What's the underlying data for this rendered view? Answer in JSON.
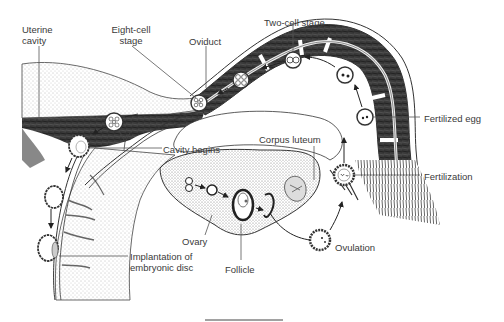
{
  "diagram": {
    "labels": {
      "uterine_cavity": [
        "Uterine",
        "cavity"
      ],
      "eight_cell_stage": [
        "Eight-cell",
        "stage"
      ],
      "oviduct": "Oviduct",
      "two_cell_stage": "Two-cell stage",
      "fertilized_egg": "Fertilized egg",
      "corpus_luteum": "Corpus luteum",
      "cavity_begins": "Cavity begins",
      "fertilization": "Fertilization",
      "ovary": "Ovary",
      "follicle": "Follicle",
      "ovulation": "Ovulation",
      "implantation": [
        "Implantation of",
        "embryonic disc"
      ]
    },
    "stages_sequence": [
      "Follicle",
      "Ovulation",
      "Fertilization",
      "Fertilized egg",
      "Two-cell stage",
      "Eight-cell stage",
      "Cavity begins",
      "Implantation of embryonic disc"
    ],
    "colors": {
      "line": "#3a3a3a",
      "dark_tissue": "#2a2a2a",
      "stipple": "#8a8a8a",
      "background": "#ffffff"
    }
  }
}
